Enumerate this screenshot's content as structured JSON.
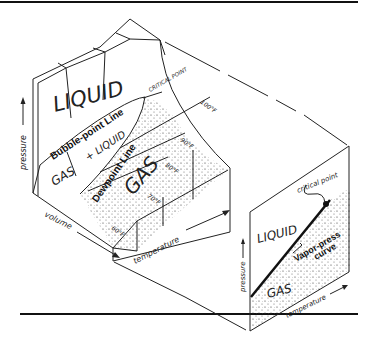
{
  "figure": {
    "main_block": {
      "regions": {
        "liquid": "LIQUID",
        "gas_liquid": "GAS + LIQUID",
        "gas_plus": "GAS",
        "plus_liquid": "+ LIQUID",
        "gas": "GAS"
      },
      "lines": {
        "bubble_point": "Bubble-point Line",
        "dewpoint": "Dewpoint Line",
        "critical_point": "CRITICAL POINT"
      },
      "isotherms": [
        "60°F",
        "70°F",
        "80°F",
        "90°F",
        "100°F"
      ],
      "axes": {
        "pressure": "pressure",
        "volume": "volume",
        "temperature": "temperature"
      }
    },
    "projection": {
      "regions": {
        "liquid": "LIQUID",
        "gas": "GAS"
      },
      "curve_label_1": "Vapor-press",
      "curve_label_2": "curve",
      "critical_point": "critical point",
      "axes": {
        "pressure": "pressure",
        "temperature": "temperature"
      }
    }
  },
  "colors": {
    "ink": "#222222",
    "paper": "#ffffff"
  }
}
